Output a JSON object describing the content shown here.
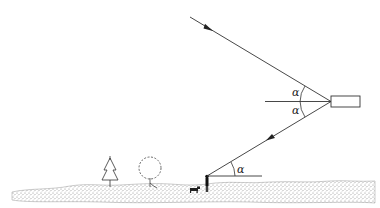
{
  "diagram": {
    "type": "reflection-geometry",
    "labels": {
      "angle_upper": "α",
      "angle_lower": "α",
      "angle_ground": "α"
    },
    "elements": [
      {
        "id": "incident-ray",
        "kind": "arrow-line",
        "direction": "toward reflector"
      },
      {
        "id": "reflector",
        "kind": "rectangle"
      },
      {
        "id": "normal-line",
        "kind": "horizontal-line"
      },
      {
        "id": "reflected-ray",
        "kind": "arrow-line",
        "direction": "toward observer"
      },
      {
        "id": "observer-horizontal",
        "kind": "horizontal-line"
      },
      {
        "id": "observer",
        "kind": "person-figure"
      },
      {
        "id": "dog",
        "kind": "animal-figure"
      },
      {
        "id": "conifer-tree",
        "kind": "tree"
      },
      {
        "id": "deciduous-tree",
        "kind": "tree"
      },
      {
        "id": "ground",
        "kind": "stippled-terrain"
      }
    ],
    "colors": {
      "line": "#333333",
      "ground": "#bdbdbd",
      "background": "#ffffff"
    }
  }
}
